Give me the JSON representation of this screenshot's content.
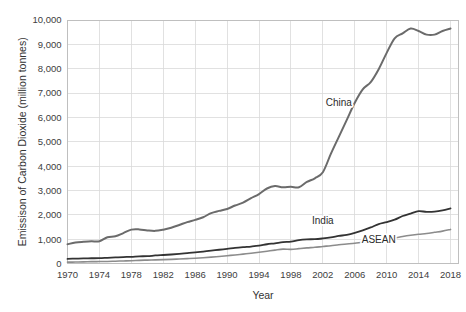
{
  "chart_data": {
    "type": "line",
    "title": "",
    "xlabel": "Year",
    "ylabel": "Emissison of Carbon Dioxide (million tonnes)",
    "xlim": [
      1970,
      2019
    ],
    "ylim": [
      0,
      10000
    ],
    "grid": true,
    "legend_position": "inline-labels",
    "x_ticks": [
      "1970",
      "1974",
      "1978",
      "1982",
      "1986",
      "1990",
      "1994",
      "1998",
      "2002",
      "2006",
      "2010",
      "2014",
      "2018"
    ],
    "y_ticks": [
      "0",
      "1,000",
      "2,000",
      "3,000",
      "4,000",
      "5,000",
      "6,000",
      "7,000",
      "8,000",
      "9,000",
      "10,000"
    ],
    "x": [
      1970,
      1971,
      1972,
      1973,
      1974,
      1975,
      1976,
      1977,
      1978,
      1979,
      1980,
      1981,
      1982,
      1983,
      1984,
      1985,
      1986,
      1987,
      1988,
      1989,
      1990,
      1991,
      1992,
      1993,
      1994,
      1995,
      1996,
      1997,
      1998,
      1999,
      2000,
      2001,
      2002,
      2003,
      2004,
      2005,
      2006,
      2007,
      2008,
      2009,
      2010,
      2011,
      2012,
      2013,
      2014,
      2015,
      2016,
      2017,
      2018
    ],
    "series": [
      {
        "name": "China",
        "color": "#6b6b6b",
        "width": 2.0,
        "label_x": 2004,
        "label_y": 6450,
        "values": [
          790,
          860,
          890,
          910,
          910,
          1080,
          1120,
          1250,
          1390,
          1400,
          1360,
          1340,
          1390,
          1470,
          1580,
          1700,
          1790,
          1900,
          2070,
          2160,
          2240,
          2380,
          2500,
          2680,
          2850,
          3080,
          3180,
          3130,
          3150,
          3130,
          3350,
          3500,
          3750,
          4500,
          5200,
          5900,
          6600,
          7150,
          7450,
          7980,
          8650,
          9250,
          9450,
          9650,
          9550,
          9400,
          9400,
          9550,
          9650
        ]
      },
      {
        "name": "India",
        "color": "#333333",
        "width": 1.8,
        "label_x": 2002,
        "label_y": 1620,
        "values": [
          190,
          200,
          210,
          215,
          220,
          235,
          250,
          265,
          275,
          295,
          300,
          330,
          350,
          370,
          395,
          425,
          455,
          490,
          525,
          565,
          600,
          640,
          670,
          695,
          730,
          790,
          830,
          880,
          900,
          960,
          990,
          1000,
          1030,
          1070,
          1130,
          1180,
          1260,
          1360,
          1480,
          1620,
          1700,
          1800,
          1950,
          2050,
          2150,
          2120,
          2130,
          2180,
          2260
        ]
      },
      {
        "name": "ASEAN",
        "color": "#8c8c8c",
        "width": 1.6,
        "label_x": 2009,
        "label_y": 830,
        "values": [
          55,
          60,
          65,
          75,
          80,
          85,
          95,
          105,
          115,
          130,
          140,
          150,
          160,
          170,
          185,
          200,
          215,
          235,
          260,
          290,
          320,
          350,
          385,
          420,
          460,
          505,
          550,
          590,
          580,
          610,
          640,
          665,
          700,
          730,
          770,
          800,
          830,
          870,
          900,
          940,
          1000,
          1050,
          1110,
          1160,
          1200,
          1230,
          1280,
          1330,
          1400
        ]
      }
    ]
  }
}
